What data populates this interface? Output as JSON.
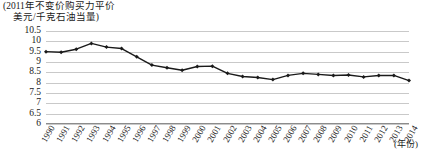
{
  "chart_data": {
    "type": "line",
    "title": "(2011年不变价购买力平价",
    "title_line2": "美元/千克石油当量)",
    "xlabel": "(年份)",
    "ylabel": "",
    "ylim": [
      6,
      10.5
    ],
    "ytick_step": 0.5,
    "grid": true,
    "legend": "none",
    "marker": "diamond",
    "line_color": "#1a1a1a",
    "grid_color": "#c9c9c9",
    "yticks": [
      "10.5",
      "10",
      "9.5",
      "9",
      "8.5",
      "8",
      "7.5",
      "7",
      "6.5",
      "6"
    ],
    "ytick_values": [
      10.5,
      10,
      9.5,
      9,
      8.5,
      8,
      7.5,
      7,
      6.5,
      6
    ],
    "categories": [
      "1990",
      "1991",
      "1992",
      "1993",
      "1994",
      "1995",
      "1996",
      "1997",
      "1998",
      "1999",
      "2000",
      "2001",
      "2002",
      "2003",
      "2004",
      "2005",
      "2006",
      "2007",
      "2008",
      "2009",
      "2010",
      "2011",
      "2012",
      "2013",
      "2014"
    ],
    "values": [
      9.5,
      9.47,
      9.62,
      9.9,
      9.72,
      9.65,
      9.25,
      8.85,
      8.72,
      8.6,
      8.78,
      8.8,
      8.45,
      8.3,
      8.25,
      8.15,
      8.35,
      8.45,
      8.4,
      8.35,
      8.37,
      8.28,
      8.35,
      8.35,
      8.1
    ]
  }
}
